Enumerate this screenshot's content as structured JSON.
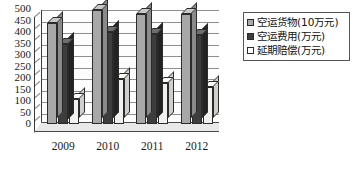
{
  "chart_data": {
    "type": "bar",
    "title": "",
    "xlabel": "",
    "ylabel": "",
    "categories": [
      "2009",
      "2010",
      "2011",
      "2012"
    ],
    "yticks": [
      0,
      50,
      100,
      150,
      200,
      250,
      300,
      350,
      400,
      450,
      500
    ],
    "ylim": [
      0,
      500
    ],
    "grid": true,
    "legend_position": "right",
    "series": [
      {
        "name": "空运货物(10万元)",
        "color": "#a8a8a8",
        "values": [
          440,
          497,
          480,
          478
        ]
      },
      {
        "name": "空运费用(万元)",
        "color": "#3d3d3d",
        "values": [
          350,
          400,
          390,
          385
        ]
      },
      {
        "name": "延期赔偿(万元)",
        "color": "#ffffff",
        "values": [
          110,
          196,
          180,
          160
        ]
      }
    ]
  },
  "legend": {
    "items": [
      {
        "label": "空运货物(10万元)"
      },
      {
        "label": "空运费用(万元)"
      },
      {
        "label": "延期赔偿(万元)"
      }
    ]
  }
}
